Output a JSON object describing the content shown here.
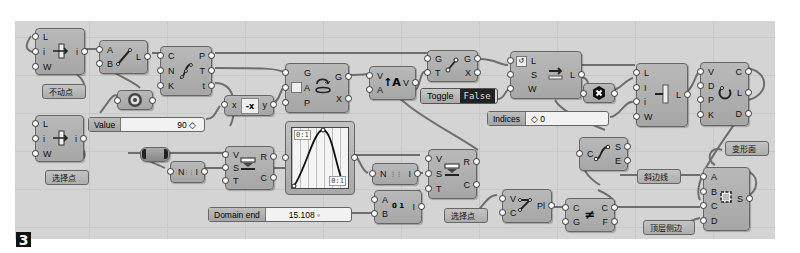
{
  "figure_badge": "3",
  "components": {
    "divide_length_1": {
      "inputs": [
        "L",
        "i",
        "W"
      ],
      "outputs": [
        "i"
      ],
      "icon": "divide-length-icon"
    },
    "line": {
      "inputs": [
        "A",
        "B"
      ],
      "outputs": [
        "L"
      ],
      "icon": "line-icon"
    },
    "evaluate_curve": {
      "inputs": [
        "C",
        "N",
        "K"
      ],
      "outputs": [
        "P",
        "T",
        "t"
      ],
      "icon": "curve-divide-icon"
    },
    "divide_length_2": {
      "inputs": [
        "L",
        "i",
        "W"
      ],
      "outputs": [
        "i"
      ],
      "icon": "divide-length-icon"
    },
    "expression": {
      "inputs": [
        "x"
      ],
      "outputs": [
        "y"
      ],
      "icon": "negative-x-icon",
      "label": "-x"
    },
    "rotate": {
      "inputs": [
        "G",
        "A",
        "P"
      ],
      "outputs": [
        "G",
        "X"
      ],
      "icon": "rotate-icon"
    },
    "amplitude": {
      "inputs": [
        "V",
        "A"
      ],
      "outputs": [
        "V"
      ],
      "icon": "amplitude-icon"
    },
    "move": {
      "inputs": [
        "G",
        "T"
      ],
      "outputs": [
        "G",
        "X"
      ],
      "icon": "move-icon"
    },
    "shift_list": {
      "inputs": [
        "L",
        "S",
        "W"
      ],
      "outputs": [
        "L"
      ],
      "icon": "shift-list-icon"
    },
    "cull_index": {
      "inputs": [
        "L",
        "I",
        "i",
        "W"
      ],
      "outputs": [
        "L"
      ],
      "icon": "cull-index-icon"
    },
    "polyline": {
      "inputs": [
        "V",
        "D",
        "P",
        "K"
      ],
      "outputs": [
        "C",
        "L",
        "D"
      ],
      "icon": "polyline-icon"
    },
    "series_1": {
      "inputs": [
        "N"
      ],
      "outputs": [
        "I"
      ],
      "icon": "series-icon"
    },
    "remap_1": {
      "inputs": [
        "V",
        "S",
        "T"
      ],
      "outputs": [
        "R",
        "C"
      ],
      "icon": "remap-icon"
    },
    "series_2": {
      "inputs": [
        "N"
      ],
      "outputs": [
        "I"
      ],
      "icon": "series-icon"
    },
    "remap_2": {
      "inputs": [
        "V",
        "S",
        "T"
      ],
      "outputs": [
        "R",
        "C"
      ],
      "icon": "remap-icon"
    },
    "construct_domain": {
      "inputs": [
        "A",
        "B"
      ],
      "outputs": [
        "I"
      ],
      "icon": "domain-icon"
    },
    "end_points": {
      "inputs": [
        "C"
      ],
      "outputs": [
        "S",
        "E"
      ],
      "icon": "endpoints-icon"
    },
    "interpolate": {
      "inputs": [
        "V",
        "C"
      ],
      "outputs": [
        "Pl"
      ],
      "icon": "interpolate-icon"
    },
    "flip_curve": {
      "inputs": [
        "C",
        "G"
      ],
      "outputs": [
        "C",
        "F"
      ],
      "icon": "flip-curve-icon"
    },
    "edge_surface": {
      "inputs": [
        "A",
        "B",
        "C",
        "D"
      ],
      "outputs": [
        "S"
      ],
      "icon": "edge-surface-icon"
    }
  },
  "params": {
    "fixed_point": "不动点",
    "select_point_1": "选择点",
    "select_point_2": "选择点",
    "oblique_line": "斜边线",
    "top_edge": "顶层侧边",
    "deformed_surface": "变形面"
  },
  "sliders": {
    "value": {
      "label": "Value",
      "value": "90"
    },
    "domain_end": {
      "label": "Domain end",
      "value": "15.108"
    },
    "indices": {
      "label": "Indices",
      "value": "0"
    }
  },
  "toggle": {
    "label": "Toggle",
    "value": "False"
  },
  "graph_mapper": {
    "top_left_tag": "0:1",
    "bottom_right_tag": "0:1",
    "type": "sine-bell"
  }
}
